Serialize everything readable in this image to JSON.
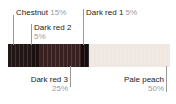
{
  "figure": {
    "type": "color-proportion-bar",
    "background": "#ffffff",
    "bar": {
      "x": 8,
      "y": 44,
      "width": 162,
      "height": 23,
      "stripe_texture": true
    }
  },
  "chart_data": {
    "type": "bar",
    "orientation": "horizontal-stacked",
    "title": "",
    "xlabel": "",
    "ylabel": "",
    "categories": [
      "Chestnut",
      "Dark red 2",
      "Dark red 3",
      "Dark red 1",
      "Pale peach"
    ],
    "values": [
      15,
      5,
      25,
      5,
      50
    ],
    "unit": "%",
    "series": [
      {
        "name": "proportion",
        "values": [
          15,
          5,
          25,
          5,
          50
        ]
      }
    ],
    "segments": [
      {
        "name": "Chestnut",
        "percent": "15%",
        "value": 15,
        "color": "#231616"
      },
      {
        "name": "Dark red 2",
        "percent": "5%",
        "value": 5,
        "color": "#1a1010"
      },
      {
        "name": "Dark red 3",
        "percent": "25%",
        "value": 25,
        "color": "#3a2121"
      },
      {
        "name": "Dark red 1",
        "percent": "5%",
        "value": 5,
        "color": "#150d0d"
      },
      {
        "name": "Pale peach",
        "percent": "50%",
        "value": 50,
        "color": "#efe7e1"
      }
    ],
    "legend_position": "callout-labels",
    "grid": false
  },
  "labels": {
    "chestnut": {
      "name": "Chestnut",
      "percent": "15%"
    },
    "dark_red_2": {
      "name": "Dark red 2",
      "percent": "5%"
    },
    "dark_red_1": {
      "name": "Dark red 1",
      "percent": "5%"
    },
    "dark_red_3": {
      "name": "Dark red 3",
      "percent": "25%"
    },
    "pale_peach": {
      "name": "Pale peach",
      "percent": "50%"
    }
  },
  "colors": {
    "leader_line": "#9a9a9a",
    "label_text": "#1b1b1b",
    "percent_text": "#9b9b9b"
  }
}
